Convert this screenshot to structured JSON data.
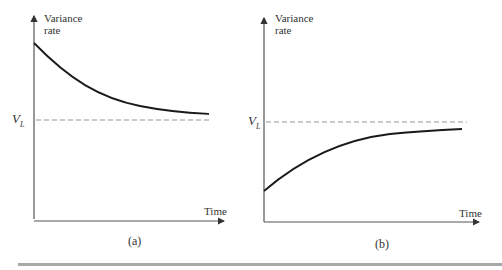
{
  "panels": [
    {
      "id": "a",
      "caption": "(a)",
      "y_axis_label_line1": "Variance",
      "y_axis_label_line2": "rate",
      "x_axis_label": "Time",
      "reference_label": "V",
      "reference_subscript": "L",
      "curve": "decays from above V_L toward V_L"
    },
    {
      "id": "b",
      "caption": "(b)",
      "y_axis_label_line1": "Variance",
      "y_axis_label_line2": "rate",
      "x_axis_label": "Time",
      "reference_label": "V",
      "reference_subscript": "L",
      "curve": "rises from below V_L toward V_L"
    }
  ],
  "colors": {
    "curve": "#1a1a1a",
    "axis": "#555555",
    "dashed": "#8a8a8a",
    "bar": "#a8a8a8"
  }
}
